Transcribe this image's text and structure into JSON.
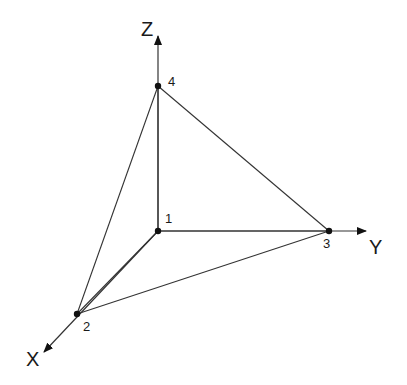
{
  "diagram": {
    "type": "tetrahedron-coordinate-diagram",
    "axes": [
      {
        "name": "Z",
        "label": "Z",
        "from": [
          158,
          231
        ],
        "to": [
          158,
          36
        ],
        "label_pos": [
          141,
          36
        ]
      },
      {
        "name": "Y",
        "label": "Y",
        "from": [
          158,
          231
        ],
        "to": [
          366,
          231
        ],
        "label_pos": [
          369,
          254
        ]
      },
      {
        "name": "X",
        "label": "X",
        "from": [
          158,
          231
        ],
        "to": [
          44,
          352
        ],
        "label_pos": [
          26,
          366
        ]
      }
    ],
    "nodes": [
      {
        "id": "1",
        "label": "1",
        "pos": [
          158,
          231
        ],
        "label_pos": [
          165,
          223
        ]
      },
      {
        "id": "2",
        "label": "2",
        "pos": [
          77,
          314
        ],
        "label_pos": [
          83,
          331
        ]
      },
      {
        "id": "3",
        "label": "3",
        "pos": [
          329,
          231
        ],
        "label_pos": [
          323,
          248
        ]
      },
      {
        "id": "4",
        "label": "4",
        "pos": [
          158,
          86
        ],
        "label_pos": [
          168,
          86
        ]
      }
    ],
    "edges": [
      [
        "1",
        "2"
      ],
      [
        "1",
        "3"
      ],
      [
        "1",
        "4"
      ],
      [
        "2",
        "3"
      ],
      [
        "2",
        "4"
      ],
      [
        "3",
        "4"
      ]
    ],
    "colors": {
      "line": "#333333",
      "node": "#111111",
      "text": "#1a1a1a"
    }
  }
}
